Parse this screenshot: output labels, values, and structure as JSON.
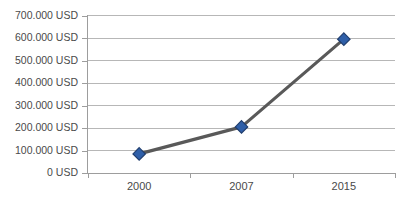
{
  "chart_data": {
    "type": "line",
    "title": "",
    "xlabel": "",
    "ylabel": "",
    "categories": [
      "2000",
      "2007",
      "2015"
    ],
    "values": [
      85000,
      205000,
      595000
    ],
    "series": [
      {
        "name": "USD",
        "values": [
          85000,
          205000,
          595000
        ]
      }
    ],
    "ylim": [
      0,
      700000
    ],
    "ytick_values": [
      0,
      100000,
      200000,
      300000,
      400000,
      500000,
      600000,
      700000
    ],
    "ytick_labels": [
      "0 USD",
      "100.000 USD",
      "200.000 USD",
      "300.000 USD",
      "400.000 USD",
      "500.000 USD",
      "600.000 USD",
      "700.000 USD"
    ],
    "xtick_labels": [
      "2000",
      "2007",
      "2015"
    ],
    "grid": true,
    "grid_axis": "y",
    "legend": false,
    "legend_position": "none",
    "marker": "diamond",
    "annotations": []
  },
  "style": {
    "line_color": "#595959",
    "marker_fill": "#2f5fa8",
    "marker_stroke": "#1f3d6e",
    "gridline_color": "#b7b7b7",
    "axis_color": "#9d9d9d",
    "tick_label_color": "#4a4a4a",
    "plot_background": "#ffffff",
    "title_color": "#9a9a9a"
  },
  "header": {
    "clipped_title": ""
  },
  "axis": {
    "y_labels": [
      {
        "text": "700.000 USD",
        "value": 700000
      },
      {
        "text": "600.000 USD",
        "value": 600000
      },
      {
        "text": "500.000 USD",
        "value": 500000
      },
      {
        "text": "400.000 USD",
        "value": 400000
      },
      {
        "text": "300.000 USD",
        "value": 300000
      },
      {
        "text": "200.000 USD",
        "value": 200000
      },
      {
        "text": "100.000 USD",
        "value": 100000
      },
      {
        "text": "0 USD",
        "value": 0
      }
    ],
    "x_labels": [
      {
        "text": "2000"
      },
      {
        "text": "2007"
      },
      {
        "text": "2015"
      }
    ]
  }
}
